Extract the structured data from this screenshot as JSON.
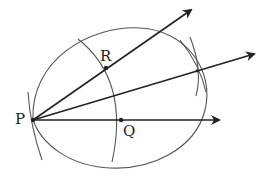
{
  "diagram": {
    "title": "",
    "points": [
      {
        "id": "P",
        "label": "P",
        "x": 33,
        "y": 120
      },
      {
        "id": "Q",
        "label": "Q",
        "x": 121,
        "y": 120
      },
      {
        "id": "R",
        "label": "R",
        "x": 106,
        "y": 68
      }
    ],
    "rays": [
      {
        "from": "P",
        "to": [
          191,
          10
        ],
        "arrow": true
      },
      {
        "from": "P",
        "to": [
          254,
          54
        ],
        "arrow": true
      },
      {
        "from": "P",
        "to": [
          219,
          120
        ],
        "arrow": true
      }
    ],
    "colors": {
      "line": "#222222",
      "arc": "#555555",
      "text": "#222222"
    }
  }
}
